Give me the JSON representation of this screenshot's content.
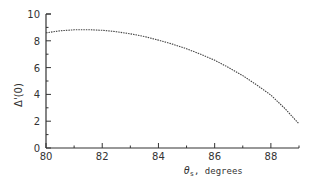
{
  "chart_data": {
    "type": "line",
    "title": "",
    "xlabel": "θs, degrees",
    "ylabel": "Δ'(0)",
    "xlim": [
      80,
      89
    ],
    "ylim": [
      0,
      10
    ],
    "x_ticks": [
      80,
      82,
      84,
      86,
      88
    ],
    "y_ticks": [
      0,
      2,
      4,
      6,
      8,
      10
    ],
    "grid": false,
    "legend": null,
    "series": [
      {
        "name": "Δ'(0)",
        "style": "dotted",
        "x": [
          80,
          80.5,
          81,
          81.5,
          82,
          82.5,
          83,
          83.5,
          84,
          84.5,
          85,
          85.5,
          86,
          86.5,
          87,
          87.5,
          88,
          88.5,
          89
        ],
        "y": [
          8.6,
          8.75,
          8.82,
          8.83,
          8.78,
          8.68,
          8.52,
          8.32,
          8.05,
          7.75,
          7.4,
          7.0,
          6.55,
          6.0,
          5.4,
          4.7,
          3.95,
          2.95,
          1.8
        ]
      }
    ]
  },
  "axes": {
    "x_tick_labels": [
      "80",
      "82",
      "84",
      "86",
      "88"
    ],
    "y_tick_labels": [
      "0",
      "2",
      "4",
      "6",
      "8",
      "10"
    ],
    "x_title_symbol": "θ",
    "x_title_sub": "s",
    "x_title_rest": ", degrees",
    "y_title": "Δ'(0)"
  }
}
